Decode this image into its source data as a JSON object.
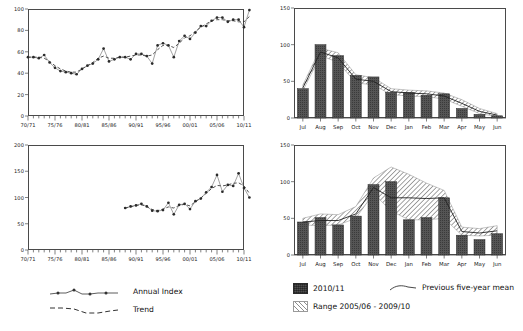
{
  "chart_data": [
    {
      "id": "top-left",
      "type": "line",
      "title": "",
      "xlabel": "",
      "ylabel": "",
      "ylim": [
        0,
        100
      ],
      "yticks": [
        0,
        20,
        40,
        60,
        80,
        100
      ],
      "ytick_labels": [
        "0",
        "20",
        "40",
        "60",
        "80",
        "100"
      ],
      "xlim": [
        "70/71",
        "10/11"
      ],
      "xtick_labels": [
        "70/71",
        "75/76",
        "80/81",
        "85/86",
        "90/91",
        "95/96",
        "00/01",
        "05/06",
        "10/11"
      ],
      "x": [
        "70/71",
        "71/72",
        "72/73",
        "73/74",
        "74/75",
        "75/76",
        "76/77",
        "77/78",
        "78/79",
        "79/80",
        "80/81",
        "81/82",
        "82/83",
        "83/84",
        "84/85",
        "85/86",
        "86/87",
        "87/88",
        "88/89",
        "89/90",
        "90/91",
        "91/92",
        "92/93",
        "93/94",
        "94/95",
        "95/96",
        "96/97",
        "97/98",
        "98/99",
        "99/00",
        "00/01",
        "01/02",
        "02/03",
        "03/04",
        "04/05",
        "05/06",
        "06/07",
        "07/08",
        "08/09",
        "09/10",
        "10/11"
      ],
      "grid": false,
      "legend_position": "below-left",
      "series": [
        {
          "name": "Annual Index",
          "style": "line-with-markers",
          "values": [
            55,
            55,
            54,
            57,
            50,
            45,
            42,
            41,
            40,
            39,
            44,
            47,
            49,
            53,
            63,
            51,
            53,
            55,
            55,
            53,
            58,
            58,
            56,
            49,
            66,
            68,
            66,
            55,
            70,
            75,
            72,
            78,
            84,
            84,
            89,
            92,
            92,
            88,
            90,
            90,
            83,
            99
          ]
        },
        {
          "name": "Trend",
          "style": "dashed",
          "values": [
            55,
            55,
            55,
            54,
            51,
            47,
            44,
            42,
            41,
            41,
            44,
            47,
            50,
            54,
            56,
            54,
            54,
            55,
            55,
            56,
            57,
            57,
            56,
            57,
            62,
            66,
            66,
            64,
            68,
            73,
            75,
            79,
            83,
            86,
            89,
            90,
            90,
            89,
            89,
            88,
            88,
            93
          ]
        }
      ]
    },
    {
      "id": "bottom-left",
      "type": "line",
      "title": "",
      "xlabel": "",
      "ylabel": "",
      "ylim": [
        0,
        200
      ],
      "yticks": [
        0,
        50,
        100,
        150,
        200
      ],
      "ytick_labels": [
        "0",
        "50",
        "100",
        "150",
        "200"
      ],
      "xlim": [
        "70/71",
        "10/11"
      ],
      "xtick_labels": [
        "70/71",
        "75/76",
        "80/81",
        "85/86",
        "90/91",
        "95/96",
        "00/01",
        "05/06",
        "10/11"
      ],
      "x": [
        "88/89",
        "89/90",
        "90/91",
        "91/92",
        "92/93",
        "93/94",
        "94/95",
        "95/96",
        "96/97",
        "97/98",
        "98/99",
        "99/00",
        "00/01",
        "01/02",
        "02/03",
        "03/04",
        "04/05",
        "05/06",
        "06/07",
        "07/08",
        "08/09",
        "09/10",
        "10/11"
      ],
      "grid": false,
      "legend_position": "below-left",
      "series": [
        {
          "name": "Annual Index",
          "style": "line-with-markers",
          "values": [
            80,
            83,
            85,
            88,
            83,
            75,
            74,
            76,
            90,
            68,
            86,
            88,
            78,
            93,
            98,
            110,
            120,
            143,
            111,
            124,
            122,
            146,
            118,
            100
          ]
        },
        {
          "name": "Trend",
          "style": "dashed",
          "values": [
            80,
            82,
            85,
            86,
            83,
            77,
            75,
            78,
            82,
            80,
            85,
            87,
            84,
            92,
            99,
            108,
            117,
            123,
            122,
            124,
            127,
            128,
            122,
            108
          ]
        }
      ]
    },
    {
      "id": "top-right",
      "type": "bar",
      "title": "",
      "xlabel": "",
      "ylabel": "",
      "ylim": [
        0,
        150
      ],
      "yticks": [
        0,
        50,
        100,
        150
      ],
      "ytick_labels": [
        "0",
        "50",
        "100",
        "150"
      ],
      "categories": [
        "Jul",
        "Aug",
        "Sep",
        "Oct",
        "Nov",
        "Dec",
        "Jan",
        "Feb",
        "Mar",
        "Apr",
        "May",
        "Jun"
      ],
      "grid": false,
      "legend_position": "below",
      "series": [
        {
          "name": "2010/11",
          "style": "bar",
          "values": [
            40,
            100,
            85,
            58,
            56,
            35,
            35,
            31,
            33,
            13,
            5,
            3
          ]
        },
        {
          "name": "Previous five-year mean",
          "style": "line",
          "values": [
            41,
            90,
            82,
            53,
            50,
            36,
            34,
            33,
            30,
            20,
            9,
            4
          ]
        },
        {
          "name": "Range 2005/06 - 2009/10",
          "style": "band",
          "low": [
            37,
            85,
            76,
            48,
            45,
            32,
            30,
            29,
            26,
            16,
            6,
            2
          ],
          "high": [
            45,
            95,
            89,
            59,
            55,
            40,
            38,
            37,
            34,
            25,
            13,
            6
          ]
        }
      ]
    },
    {
      "id": "bottom-right",
      "type": "bar",
      "title": "",
      "xlabel": "",
      "ylabel": "",
      "ylim": [
        0,
        150
      ],
      "yticks": [
        0,
        50,
        100,
        150
      ],
      "ytick_labels": [
        "0",
        "50",
        "100",
        "150"
      ],
      "categories": [
        "Jul",
        "Aug",
        "Sep",
        "Oct",
        "Nov",
        "Dec",
        "Jan",
        "Feb",
        "Mar",
        "Apr",
        "May",
        "Jun"
      ],
      "grid": false,
      "legend_position": "below",
      "series": [
        {
          "name": "2010/11",
          "style": "bar",
          "values": [
            45,
            51,
            41,
            53,
            96,
            100,
            48,
            51,
            78,
            27,
            21,
            29
          ]
        },
        {
          "name": "Previous five-year mean",
          "style": "line",
          "values": [
            45,
            47,
            47,
            56,
            92,
            78,
            78,
            77,
            78,
            32,
            30,
            33
          ]
        },
        {
          "name": "Range 2005/06 - 2009/10",
          "style": "band",
          "low": [
            41,
            40,
            41,
            50,
            84,
            60,
            48,
            48,
            50,
            27,
            26,
            27
          ],
          "high": [
            50,
            56,
            55,
            66,
            105,
            120,
            110,
            98,
            88,
            38,
            36,
            40
          ]
        }
      ]
    }
  ],
  "legend_left": {
    "items": [
      {
        "label": "Annual Index",
        "marker": "line-dots"
      },
      {
        "label": "Trend",
        "marker": "dashed-line"
      }
    ]
  },
  "legend_right": {
    "items": [
      {
        "label": "2010/11",
        "marker": "solid-swatch"
      },
      {
        "label": "Previous five-year mean",
        "marker": "mean-line"
      },
      {
        "label": "Range 2005/06 - 2009/10",
        "marker": "hatched-swatch"
      }
    ]
  }
}
